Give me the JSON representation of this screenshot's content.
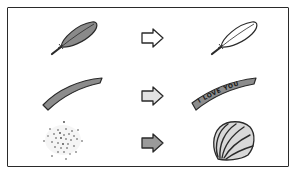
{
  "diagram": {
    "type": "transformation-illustration",
    "rows": [
      {
        "from": {
          "name": "gray-feather",
          "fill": "#8a8a8a"
        },
        "arrow": {
          "fill": "#ffffff"
        },
        "to": {
          "name": "white-feather",
          "fill": "#ffffff"
        }
      },
      {
        "from": {
          "name": "gray-strip",
          "fill": "#8c8c8c"
        },
        "arrow": {
          "fill": "#e2e2e2"
        },
        "to": {
          "name": "ribbon",
          "fill": "#8c8c8c",
          "text": "I LOVE YOU"
        }
      },
      {
        "from": {
          "name": "sand-grains",
          "fill": "#555555"
        },
        "arrow": {
          "fill": "#9a9a9a"
        },
        "to": {
          "name": "seashell",
          "fill": "#d8d8d8"
        }
      }
    ],
    "colors": {
      "stroke": "#2a2a2a",
      "background": "#ffffff"
    }
  }
}
